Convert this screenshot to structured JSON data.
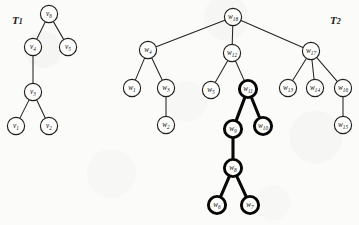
{
  "figure": {
    "width": 359,
    "height": 225,
    "background_color": "#fbfbfa",
    "ink_color": "#1f1f1f",
    "highlight_color": "#060606"
  },
  "trees": [
    {
      "id": "T1",
      "label_text": "T",
      "label_sub": "1",
      "label_x": 12,
      "label_y": 14,
      "node_radius": 8.6,
      "nodes": [
        {
          "id": "v6",
          "text": "v",
          "sub": "6",
          "x": 49,
          "y": 14,
          "bold": false
        },
        {
          "id": "v4",
          "text": "v",
          "sub": "4",
          "x": 33,
          "y": 47,
          "bold": false
        },
        {
          "id": "v5",
          "text": "v",
          "sub": "5",
          "x": 68,
          "y": 47,
          "bold": false
        },
        {
          "id": "v3",
          "text": "v",
          "sub": "3",
          "x": 33,
          "y": 92,
          "bold": false
        },
        {
          "id": "v1",
          "text": "v",
          "sub": "1",
          "x": 16,
          "y": 126,
          "bold": false
        },
        {
          "id": "v2",
          "text": "v",
          "sub": "2",
          "x": 49,
          "y": 126,
          "bold": false
        }
      ],
      "edges": [
        {
          "from": "v6",
          "to": "v4",
          "bold": false
        },
        {
          "from": "v6",
          "to": "v5",
          "bold": false
        },
        {
          "from": "v4",
          "to": "v3",
          "bold": false
        },
        {
          "from": "v3",
          "to": "v1",
          "bold": false
        },
        {
          "from": "v3",
          "to": "v2",
          "bold": false
        }
      ]
    },
    {
      "id": "T2",
      "label_text": "T",
      "label_sub": "2",
      "label_x": 330,
      "label_y": 14,
      "node_radius": 8.6,
      "nodes": [
        {
          "id": "w18",
          "text": "w",
          "sub": "18",
          "x": 233,
          "y": 17,
          "bold": false
        },
        {
          "id": "w4",
          "text": "w",
          "sub": "4",
          "x": 148,
          "y": 50,
          "bold": false
        },
        {
          "id": "w12",
          "text": "w",
          "sub": "12",
          "x": 232,
          "y": 53,
          "bold": false
        },
        {
          "id": "w17",
          "text": "w",
          "sub": "17",
          "x": 311,
          "y": 51,
          "bold": false
        },
        {
          "id": "w1",
          "text": "w",
          "sub": "1",
          "x": 132,
          "y": 88,
          "bold": false
        },
        {
          "id": "w3",
          "text": "w",
          "sub": "3",
          "x": 166,
          "y": 88,
          "bold": false
        },
        {
          "id": "w2",
          "text": "w",
          "sub": "2",
          "x": 166,
          "y": 125,
          "bold": false
        },
        {
          "id": "w5",
          "text": "w",
          "sub": "5",
          "x": 211,
          "y": 90,
          "bold": false
        },
        {
          "id": "w11",
          "text": "w",
          "sub": "11",
          "x": 248,
          "y": 89,
          "bold": true
        },
        {
          "id": "w9",
          "text": "w",
          "sub": "9",
          "x": 233,
          "y": 129,
          "bold": true
        },
        {
          "id": "w10",
          "text": "w",
          "sub": "10",
          "x": 263,
          "y": 126,
          "bold": true
        },
        {
          "id": "w8",
          "text": "w",
          "sub": "8",
          "x": 233,
          "y": 168,
          "bold": true
        },
        {
          "id": "w6",
          "text": "w",
          "sub": "6",
          "x": 217,
          "y": 205,
          "bold": true
        },
        {
          "id": "w7",
          "text": "w",
          "sub": "7",
          "x": 250,
          "y": 205,
          "bold": true
        },
        {
          "id": "w13",
          "text": "w",
          "sub": "13",
          "x": 288,
          "y": 88,
          "bold": false
        },
        {
          "id": "w14",
          "text": "w",
          "sub": "14",
          "x": 315,
          "y": 88,
          "bold": false
        },
        {
          "id": "w16",
          "text": "w",
          "sub": "16",
          "x": 343,
          "y": 88,
          "bold": false
        },
        {
          "id": "w15",
          "text": "w",
          "sub": "15",
          "x": 343,
          "y": 125,
          "bold": false
        }
      ],
      "edges": [
        {
          "from": "w18",
          "to": "w4",
          "bold": false
        },
        {
          "from": "w18",
          "to": "w12",
          "bold": false
        },
        {
          "from": "w18",
          "to": "w17",
          "bold": false
        },
        {
          "from": "w4",
          "to": "w1",
          "bold": false
        },
        {
          "from": "w4",
          "to": "w3",
          "bold": false
        },
        {
          "from": "w3",
          "to": "w2",
          "bold": false
        },
        {
          "from": "w12",
          "to": "w5",
          "bold": false
        },
        {
          "from": "w12",
          "to": "w11",
          "bold": false
        },
        {
          "from": "w11",
          "to": "w9",
          "bold": true
        },
        {
          "from": "w11",
          "to": "w10",
          "bold": true
        },
        {
          "from": "w9",
          "to": "w8",
          "bold": true
        },
        {
          "from": "w8",
          "to": "w6",
          "bold": true
        },
        {
          "from": "w8",
          "to": "w7",
          "bold": true
        },
        {
          "from": "w17",
          "to": "w13",
          "bold": false
        },
        {
          "from": "w17",
          "to": "w14",
          "bold": false
        },
        {
          "from": "w17",
          "to": "w16",
          "bold": false
        },
        {
          "from": "w16",
          "to": "w15",
          "bold": false
        }
      ]
    }
  ]
}
